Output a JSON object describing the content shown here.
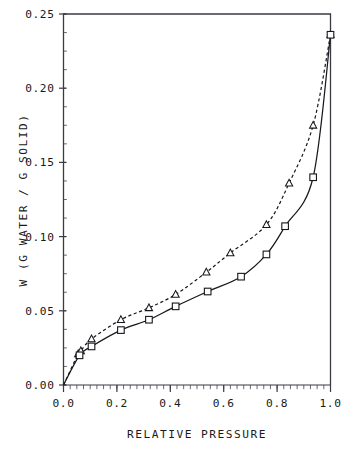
{
  "chart_data": {
    "type": "scatter",
    "title": "",
    "xlabel": "RELATIVE PRESSURE",
    "ylabel": "W (G WATER / G SOLID)",
    "xlim": [
      0.0,
      1.0
    ],
    "ylim": [
      0.0,
      0.25
    ],
    "grid": false,
    "legend": "none",
    "x_ticks": [
      0.0,
      0.2,
      0.4,
      0.6,
      0.8,
      1.0
    ],
    "x_tick_labels": [
      "0.0",
      "0.2",
      "0.4",
      "0.6",
      "0.8",
      "1.0"
    ],
    "x_minor_tick_step": 0.025,
    "y_ticks": [
      0.0,
      0.05,
      0.1,
      0.15,
      0.2,
      0.25
    ],
    "y_tick_labels": [
      "0.00",
      "0.05",
      "0.10",
      "0.15",
      "0.20",
      "0.25"
    ],
    "y_minor_tick_step": 0.0125,
    "series": [
      {
        "name": "triangle-series",
        "marker": "triangle",
        "line_style": "dashed",
        "x": [
          0.055,
          0.065,
          0.105,
          0.215,
          0.32,
          0.42,
          0.535,
          0.625,
          0.76,
          0.845,
          0.935,
          1.0
        ],
        "y": [
          0.021,
          0.023,
          0.031,
          0.044,
          0.052,
          0.061,
          0.076,
          0.089,
          0.108,
          0.136,
          0.175,
          0.236
        ]
      },
      {
        "name": "square-series",
        "marker": "square",
        "line_style": "solid",
        "x": [
          0.06,
          0.105,
          0.215,
          0.32,
          0.42,
          0.54,
          0.665,
          0.76,
          0.83,
          0.935,
          1.0
        ],
        "y": [
          0.02,
          0.026,
          0.037,
          0.044,
          0.053,
          0.063,
          0.073,
          0.088,
          0.107,
          0.14,
          0.236
        ]
      }
    ]
  },
  "axes": {
    "x_title": "RELATIVE PRESSURE",
    "y_title": "W (G WATER / G SOLID)"
  }
}
